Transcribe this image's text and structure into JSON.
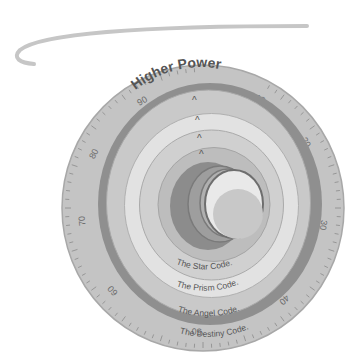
{
  "diagram": {
    "title_label": "Higher Power",
    "dial": {
      "scale_labels": [
        "10",
        "20",
        "30",
        "40",
        "50",
        "60",
        "70",
        "80",
        "90"
      ],
      "scale_label_angles_deg": [
        28,
        58,
        98,
        138,
        183,
        228,
        264,
        296,
        330
      ]
    },
    "rings": [
      {
        "label": "The Destiny Code.",
        "marker": "^",
        "fill": "#c9c9c9"
      },
      {
        "label": "The Angel Code.",
        "marker": "^",
        "fill": "#e2e2e2"
      },
      {
        "label": "The Prism Code.",
        "marker": "^",
        "fill": "#d0d0d0"
      },
      {
        "label": "The Star Code.",
        "marker": "^",
        "fill": "#bdbdbd"
      }
    ],
    "colors": {
      "scale_band": "#c4c4c4",
      "scale_edge": "#a8a8a8",
      "dark_ring": "#8f8f8f",
      "crescent_outer": "#8c8c8c",
      "crescent_mid": "#9e9e9e",
      "crescent_inner": "#b0b0b0",
      "moon_light": "#e9e9e9",
      "moon_shade": "#c8c8c8",
      "text": "#555555",
      "swoosh": "#c6c6c6"
    }
  }
}
